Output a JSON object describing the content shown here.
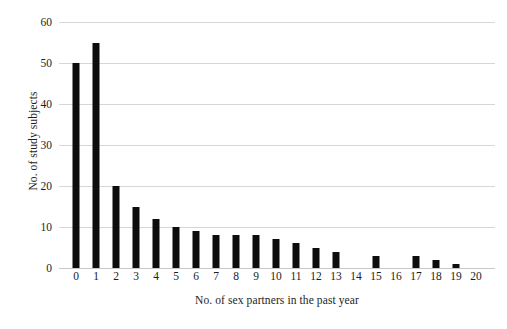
{
  "chart_data": {
    "type": "bar",
    "title": "",
    "xlabel": "No. of sex partners in the past year",
    "ylabel": "No. of study subjects",
    "categories": [
      "0",
      "1",
      "2",
      "3",
      "4",
      "5",
      "6",
      "7",
      "8",
      "9",
      "10",
      "11",
      "12",
      "13",
      "14",
      "15",
      "16",
      "17",
      "18",
      "19",
      "20"
    ],
    "values": [
      50,
      55,
      20,
      15,
      12,
      10,
      9,
      8,
      8,
      8,
      7,
      6,
      5,
      4,
      0,
      3,
      0,
      3,
      2,
      1,
      0
    ],
    "ylim": [
      0,
      60
    ],
    "yticks": [
      0,
      10,
      20,
      30,
      40,
      50,
      60
    ],
    "ytick_labels": [
      "0",
      "10",
      "20",
      "30",
      "40",
      "50",
      "60"
    ],
    "xlim": [
      0,
      20
    ],
    "grid": "horizontal",
    "legend": "none",
    "bar_color": "#0d0d0d",
    "gridline_color": "#d7d7d7"
  }
}
